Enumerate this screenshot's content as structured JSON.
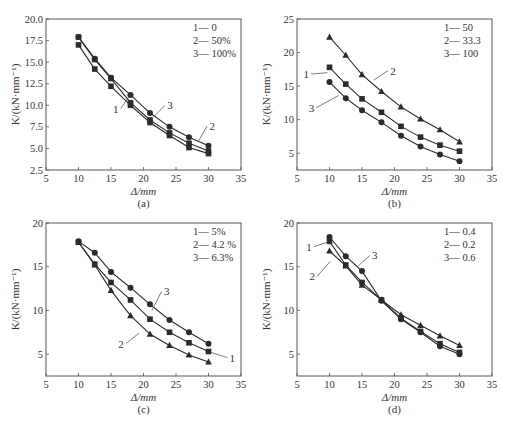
{
  "chart_data": [
    {
      "id": "a",
      "type": "line",
      "caption": "(a)",
      "xlabel": "Δ/mm",
      "ylabel": "K/(kN·mm⁻¹)",
      "xlim": [
        5,
        35
      ],
      "ylim": [
        2.5,
        20.0
      ],
      "xticks": [
        "5",
        "10",
        "15",
        "20",
        "25",
        "30",
        "35"
      ],
      "yticks": [
        "2.5",
        "5.0",
        "7.5",
        "10.0",
        "12.5",
        "15.0",
        "17.5",
        "20.0"
      ],
      "ytick_values": [
        2.5,
        5.0,
        7.5,
        10.0,
        12.5,
        15.0,
        17.5,
        20.0
      ],
      "grid": false,
      "legend": [
        "1— 0",
        "2— 50%",
        "3— 100%"
      ],
      "x": [
        10,
        12.5,
        15,
        18,
        21,
        24,
        27,
        30
      ],
      "series": [
        {
          "name": "1",
          "label": "0",
          "marker": "square",
          "values": [
            17.0,
            14.2,
            12.2,
            10.0,
            8.0,
            6.5,
            5.1,
            4.4
          ]
        },
        {
          "name": "2",
          "label": "50%",
          "marker": "square",
          "values": [
            17.9,
            15.3,
            13.1,
            10.3,
            8.3,
            6.8,
            5.6,
            4.7
          ]
        },
        {
          "name": "3",
          "label": "100%",
          "marker": "circle",
          "values": [
            17.9,
            15.4,
            13.2,
            11.2,
            9.1,
            7.5,
            6.3,
            5.3
          ]
        }
      ],
      "annotations": [
        {
          "text": "1",
          "x": 16.5,
          "y": 9.6,
          "lx": 18.0,
          "ly": 11.3
        },
        {
          "text": "3",
          "x": 23.3,
          "y": 10.0,
          "lx": 21.5,
          "ly": 8.6
        },
        {
          "text": "2",
          "x": 29.8,
          "y": 7.6,
          "lx": 28.5,
          "ly": 5.9
        }
      ]
    },
    {
      "id": "b",
      "type": "line",
      "caption": "(b)",
      "xlabel": "Δ/mm",
      "ylabel": "K/(kN·mm⁻¹)",
      "xlim": [
        5,
        35
      ],
      "ylim": [
        2.5,
        25
      ],
      "xticks": [
        "5",
        "10",
        "15",
        "20",
        "25",
        "30",
        "35"
      ],
      "yticks": [
        "5",
        "10",
        "15",
        "20",
        "25"
      ],
      "ytick_values": [
        5,
        10,
        15,
        20,
        25
      ],
      "grid": false,
      "legend": [
        "1— 50",
        "2— 33.3",
        "3— 100"
      ],
      "x": [
        10,
        12.5,
        15,
        18,
        21,
        24,
        27,
        30
      ],
      "series": [
        {
          "name": "1",
          "label": "50",
          "marker": "square",
          "values": [
            17.8,
            15.3,
            13.1,
            11.1,
            9.0,
            7.4,
            6.2,
            5.3
          ]
        },
        {
          "name": "2",
          "label": "33.3",
          "marker": "triangle",
          "values": [
            22.3,
            19.6,
            16.7,
            14.2,
            11.9,
            10.1,
            8.5,
            6.7
          ]
        },
        {
          "name": "3",
          "label": "100",
          "marker": "circle",
          "values": [
            15.6,
            13.2,
            11.4,
            9.6,
            7.6,
            6.0,
            4.8,
            3.8
          ]
        }
      ],
      "annotations": [
        {
          "text": "1",
          "x": 7.2,
          "y": 16.8,
          "lx": 9.7,
          "ly": 17.0
        },
        {
          "text": "2",
          "x": 19.0,
          "y": 17.3,
          "lx": 16.8,
          "ly": 15.9
        },
        {
          "text": "3",
          "x": 8.0,
          "y": 11.8,
          "lx": 11.4,
          "ly": 13.6
        }
      ]
    },
    {
      "id": "c",
      "type": "line",
      "caption": "(c)",
      "xlabel": "Δ/mm",
      "ylabel": "K/(kN·mm⁻¹)",
      "xlim": [
        5,
        35
      ],
      "ylim": [
        2.5,
        20
      ],
      "xticks": [
        "5",
        "10",
        "15",
        "20",
        "25",
        "30",
        "35"
      ],
      "yticks": [
        "5",
        "10",
        "15",
        "20"
      ],
      "ytick_values": [
        5,
        10,
        15,
        20
      ],
      "grid": false,
      "legend": [
        "1— 5%",
        "2— 4.2 %",
        "3— 6.3%"
      ],
      "x": [
        10,
        12.5,
        15,
        18,
        21,
        24,
        27,
        30
      ],
      "series": [
        {
          "name": "1",
          "label": "5%",
          "marker": "square",
          "values": [
            17.8,
            15.3,
            13.2,
            11.2,
            9.0,
            7.5,
            6.3,
            5.3
          ]
        },
        {
          "name": "2",
          "label": "4.2 %",
          "marker": "triangle",
          "values": [
            17.8,
            15.2,
            12.3,
            9.4,
            7.3,
            6.0,
            4.9,
            4.1
          ]
        },
        {
          "name": "3",
          "label": "6.3%",
          "marker": "circle",
          "values": [
            17.9,
            16.6,
            14.4,
            12.6,
            10.7,
            8.9,
            7.5,
            6.2
          ]
        }
      ],
      "annotations": [
        {
          "text": "1",
          "x": 32.9,
          "y": 4.6,
          "lx": 30.4,
          "ly": 5.2
        },
        {
          "text": "2",
          "x": 17.3,
          "y": 6.2,
          "lx": 19.3,
          "ly": 7.4
        },
        {
          "text": "3",
          "x": 22.8,
          "y": 12.2,
          "lx": 21.3,
          "ly": 10.0
        }
      ]
    },
    {
      "id": "d",
      "type": "line",
      "caption": "(d)",
      "xlabel": "Δ/mm",
      "ylabel": "K/(kN·mm⁻¹)",
      "xlim": [
        5,
        35
      ],
      "ylim": [
        2.5,
        20
      ],
      "xticks": [
        "5",
        "10",
        "15",
        "20",
        "25",
        "30",
        "35"
      ],
      "yticks": [
        "5",
        "10",
        "15",
        "20"
      ],
      "ytick_values": [
        5,
        10,
        15,
        20
      ],
      "grid": false,
      "legend": [
        "1— 0.4",
        "2— 0.2",
        "3— 0.6"
      ],
      "x": [
        10,
        12.5,
        15,
        18,
        21,
        24,
        27,
        30
      ],
      "series": [
        {
          "name": "1",
          "label": "0.4",
          "marker": "square",
          "values": [
            17.9,
            15.2,
            13.2,
            11.2,
            9.1,
            7.6,
            6.2,
            5.2
          ]
        },
        {
          "name": "2",
          "label": "0.2",
          "marker": "triangle",
          "values": [
            16.8,
            15.1,
            12.9,
            11.2,
            9.5,
            8.3,
            7.1,
            6.0
          ]
        },
        {
          "name": "3",
          "label": "0.6",
          "marker": "circle",
          "values": [
            18.4,
            16.2,
            14.5,
            11.1,
            9.0,
            7.5,
            5.9,
            5.0
          ]
        }
      ],
      "annotations": [
        {
          "text": "1",
          "x": 7.6,
          "y": 17.3,
          "lx": 9.7,
          "ly": 17.8
        },
        {
          "text": "2",
          "x": 8.1,
          "y": 13.9,
          "lx": 10.1,
          "ly": 15.6
        },
        {
          "text": "3",
          "x": 16.2,
          "y": 16.3,
          "lx": 14.3,
          "ly": 15.0
        }
      ]
    }
  ],
  "layout": {
    "panels": [
      {
        "left": 46,
        "top": 19,
        "width": 195,
        "height": 151
      },
      {
        "left": 297,
        "top": 19,
        "width": 195,
        "height": 151
      },
      {
        "left": 46,
        "top": 223,
        "width": 195,
        "height": 153
      },
      {
        "left": 297,
        "top": 223,
        "width": 195,
        "height": 153
      }
    ]
  }
}
